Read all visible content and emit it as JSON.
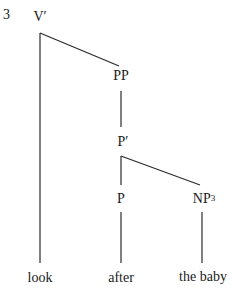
{
  "example_number": "3",
  "nodes": {
    "vbar": "V′",
    "pp": "PP",
    "pbar": "P′",
    "p": "P",
    "np": "NP",
    "np_index": "3"
  },
  "leaves": {
    "look": "look",
    "after": "after",
    "the_baby": "the baby"
  },
  "line_color": "#2a2a2a"
}
